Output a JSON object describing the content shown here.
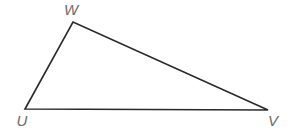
{
  "diagram": {
    "type": "triangle",
    "line_color": "#2a2a2a",
    "label_color": "#6b6b6b",
    "vertices": [
      {
        "name": "W",
        "x": 73,
        "y": 22,
        "label_x": 71,
        "label_y": 15
      },
      {
        "name": "U",
        "x": 25,
        "y": 109,
        "label_x": 22,
        "label_y": 126
      },
      {
        "name": "V",
        "x": 268,
        "y": 110,
        "label_x": 273,
        "label_y": 126
      }
    ],
    "edges": [
      {
        "from": "U",
        "to": "W"
      },
      {
        "from": "W",
        "to": "V"
      },
      {
        "from": "U",
        "to": "V"
      }
    ],
    "labels": {
      "w": "W",
      "u": "U",
      "v": "V"
    }
  }
}
